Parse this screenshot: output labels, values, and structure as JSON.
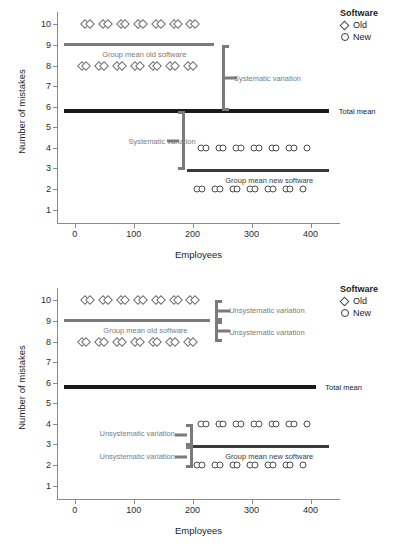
{
  "legend": {
    "title": "Software",
    "items": [
      {
        "label": "Old",
        "glyph": "diamond-icon"
      },
      {
        "label": "New",
        "glyph": "circle-icon"
      }
    ]
  },
  "chart_data": [
    {
      "type": "scatter",
      "panel": "top",
      "title": "",
      "xlabel": "Employees",
      "ylabel": "Number of mistakes",
      "xlim": [
        -30,
        450
      ],
      "ylim": [
        0.3,
        10.6
      ],
      "xticks": [
        0,
        100,
        200,
        300,
        400
      ],
      "yticks": [
        1,
        2,
        3,
        4,
        5,
        6,
        7,
        8,
        9,
        10
      ],
      "grid": false,
      "legend_position": "top-right",
      "series": [
        {
          "name": "Old",
          "marker": "diamond",
          "color": "#6e6e6e",
          "points": [
            {
              "x": 18,
              "y": 10
            },
            {
              "x": 26,
              "y": 10
            },
            {
              "x": 48,
              "y": 10
            },
            {
              "x": 56,
              "y": 10
            },
            {
              "x": 78,
              "y": 10
            },
            {
              "x": 86,
              "y": 10
            },
            {
              "x": 108,
              "y": 10
            },
            {
              "x": 116,
              "y": 10
            },
            {
              "x": 138,
              "y": 10
            },
            {
              "x": 146,
              "y": 10
            },
            {
              "x": 168,
              "y": 10
            },
            {
              "x": 176,
              "y": 10
            },
            {
              "x": 196,
              "y": 10
            },
            {
              "x": 204,
              "y": 10
            },
            {
              "x": 12,
              "y": 8
            },
            {
              "x": 20,
              "y": 8
            },
            {
              "x": 42,
              "y": 8
            },
            {
              "x": 50,
              "y": 8
            },
            {
              "x": 72,
              "y": 8
            },
            {
              "x": 80,
              "y": 8
            },
            {
              "x": 102,
              "y": 8
            },
            {
              "x": 110,
              "y": 8
            },
            {
              "x": 132,
              "y": 8
            },
            {
              "x": 140,
              "y": 8
            },
            {
              "x": 162,
              "y": 8
            },
            {
              "x": 170,
              "y": 8
            },
            {
              "x": 192,
              "y": 8
            },
            {
              "x": 200,
              "y": 8
            }
          ]
        },
        {
          "name": "New",
          "marker": "circle",
          "color": "#4a4a4a",
          "points": [
            {
              "x": 214,
              "y": 4
            },
            {
              "x": 222,
              "y": 4
            },
            {
              "x": 244,
              "y": 4
            },
            {
              "x": 252,
              "y": 4
            },
            {
              "x": 274,
              "y": 4
            },
            {
              "x": 282,
              "y": 4
            },
            {
              "x": 304,
              "y": 4
            },
            {
              "x": 312,
              "y": 4
            },
            {
              "x": 334,
              "y": 4
            },
            {
              "x": 342,
              "y": 4
            },
            {
              "x": 364,
              "y": 4
            },
            {
              "x": 372,
              "y": 4
            },
            {
              "x": 394,
              "y": 4
            },
            {
              "x": 208,
              "y": 2
            },
            {
              "x": 216,
              "y": 2
            },
            {
              "x": 238,
              "y": 2
            },
            {
              "x": 246,
              "y": 2
            },
            {
              "x": 268,
              "y": 2
            },
            {
              "x": 276,
              "y": 2
            },
            {
              "x": 298,
              "y": 2
            },
            {
              "x": 306,
              "y": 2
            },
            {
              "x": 328,
              "y": 2
            },
            {
              "x": 336,
              "y": 2
            },
            {
              "x": 358,
              "y": 2
            },
            {
              "x": 366,
              "y": 2
            },
            {
              "x": 388,
              "y": 2
            }
          ]
        }
      ],
      "reference_lines": [
        {
          "name": "Group mean old software",
          "y": 9.0,
          "x_start": -18,
          "x_end": 237,
          "color": "#7b7b7b"
        },
        {
          "name": "Total mean",
          "y": 5.8,
          "x_start": -18,
          "x_end": 432,
          "color": "#1a1a1a"
        },
        {
          "name": "Group mean new software",
          "y": 2.9,
          "x_start": 190,
          "x_end": 432,
          "color": "#3a3a3a"
        }
      ],
      "annotations": [
        {
          "text": "Group mean old software",
          "x": 118,
          "y": 8.55
        },
        {
          "text": "Total mean",
          "x": 448,
          "y": 5.8
        },
        {
          "text": "Group mean new software",
          "x": 330,
          "y": 2.45
        },
        {
          "text": "Systematic variation",
          "x": 270,
          "y": 7.4
        },
        {
          "text": "Systematic variation",
          "x": 100,
          "y": 4.35
        }
      ],
      "brackets": [
        {
          "label": "Systematic variation",
          "x": 250,
          "y_top": 9.0,
          "y_bottom": 5.8,
          "side": "right"
        },
        {
          "label": "Systematic variation",
          "x": 182,
          "y_top": 5.8,
          "y_bottom": 2.9,
          "side": "left"
        }
      ]
    },
    {
      "type": "scatter",
      "panel": "bottom",
      "title": "",
      "xlabel": "Employees",
      "ylabel": "Number of mistakes",
      "xlim": [
        -30,
        450
      ],
      "ylim": [
        0.3,
        10.6
      ],
      "xticks": [
        0,
        100,
        200,
        300,
        400
      ],
      "yticks": [
        1,
        2,
        3,
        4,
        5,
        6,
        7,
        8,
        9,
        10
      ],
      "grid": false,
      "legend_position": "top-right",
      "series": [
        {
          "name": "Old",
          "marker": "diamond",
          "color": "#6e6e6e",
          "points": [
            {
              "x": 18,
              "y": 10
            },
            {
              "x": 26,
              "y": 10
            },
            {
              "x": 48,
              "y": 10
            },
            {
              "x": 56,
              "y": 10
            },
            {
              "x": 78,
              "y": 10
            },
            {
              "x": 86,
              "y": 10
            },
            {
              "x": 108,
              "y": 10
            },
            {
              "x": 116,
              "y": 10
            },
            {
              "x": 138,
              "y": 10
            },
            {
              "x": 146,
              "y": 10
            },
            {
              "x": 168,
              "y": 10
            },
            {
              "x": 176,
              "y": 10
            },
            {
              "x": 196,
              "y": 10
            },
            {
              "x": 204,
              "y": 10
            },
            {
              "x": 12,
              "y": 8
            },
            {
              "x": 20,
              "y": 8
            },
            {
              "x": 42,
              "y": 8
            },
            {
              "x": 50,
              "y": 8
            },
            {
              "x": 72,
              "y": 8
            },
            {
              "x": 80,
              "y": 8
            },
            {
              "x": 102,
              "y": 8
            },
            {
              "x": 110,
              "y": 8
            },
            {
              "x": 132,
              "y": 8
            },
            {
              "x": 140,
              "y": 8
            },
            {
              "x": 162,
              "y": 8
            },
            {
              "x": 170,
              "y": 8
            },
            {
              "x": 192,
              "y": 8
            },
            {
              "x": 200,
              "y": 8
            }
          ]
        },
        {
          "name": "New",
          "marker": "circle",
          "color": "#4a4a4a",
          "points": [
            {
              "x": 214,
              "y": 4
            },
            {
              "x": 222,
              "y": 4
            },
            {
              "x": 244,
              "y": 4
            },
            {
              "x": 252,
              "y": 4
            },
            {
              "x": 274,
              "y": 4
            },
            {
              "x": 282,
              "y": 4
            },
            {
              "x": 304,
              "y": 4
            },
            {
              "x": 312,
              "y": 4
            },
            {
              "x": 334,
              "y": 4
            },
            {
              "x": 342,
              "y": 4
            },
            {
              "x": 364,
              "y": 4
            },
            {
              "x": 372,
              "y": 4
            },
            {
              "x": 394,
              "y": 4
            },
            {
              "x": 208,
              "y": 2
            },
            {
              "x": 216,
              "y": 2
            },
            {
              "x": 238,
              "y": 2
            },
            {
              "x": 246,
              "y": 2
            },
            {
              "x": 268,
              "y": 2
            },
            {
              "x": 276,
              "y": 2
            },
            {
              "x": 298,
              "y": 2
            },
            {
              "x": 306,
              "y": 2
            },
            {
              "x": 328,
              "y": 2
            },
            {
              "x": 336,
              "y": 2
            },
            {
              "x": 358,
              "y": 2
            },
            {
              "x": 366,
              "y": 2
            },
            {
              "x": 388,
              "y": 2
            }
          ]
        }
      ],
      "reference_lines": [
        {
          "name": "Group mean old software",
          "y": 9.0,
          "x_start": -18,
          "x_end": 230,
          "color": "#7b7b7b"
        },
        {
          "name": "Total mean",
          "y": 5.8,
          "x_start": -18,
          "x_end": 410,
          "color": "#1a1a1a"
        },
        {
          "name": "Group mean new software",
          "y": 2.9,
          "x_start": 190,
          "x_end": 432,
          "color": "#3a3a3a"
        }
      ],
      "annotations": [
        {
          "text": "Group mean old software",
          "x": 120,
          "y": 8.55
        },
        {
          "text": "Total mean",
          "x": 425,
          "y": 5.8
        },
        {
          "text": "Group mean new software",
          "x": 330,
          "y": 2.45
        },
        {
          "text": "Unsystematic variation",
          "x": 262,
          "y": 9.55
        },
        {
          "text": "Unsystematic variation",
          "x": 262,
          "y": 8.45
        },
        {
          "text": "Unsystematic variation",
          "x": 92,
          "y": 3.55
        },
        {
          "text": "Unsystematic variation",
          "x": 92,
          "y": 2.45
        }
      ],
      "brackets": [
        {
          "label": "Unsystematic variation",
          "x": 238,
          "y_top": 10.0,
          "y_bottom": 9.0,
          "side": "right"
        },
        {
          "label": "Unsystematic variation",
          "x": 238,
          "y_top": 9.0,
          "y_bottom": 8.0,
          "side": "right"
        },
        {
          "label": "Unsystematic variation",
          "x": 196,
          "y_top": 4.0,
          "y_bottom": 2.9,
          "side": "left"
        },
        {
          "label": "Unsystematic variation",
          "x": 196,
          "y_top": 2.9,
          "y_bottom": 1.85,
          "side": "left"
        }
      ]
    }
  ]
}
